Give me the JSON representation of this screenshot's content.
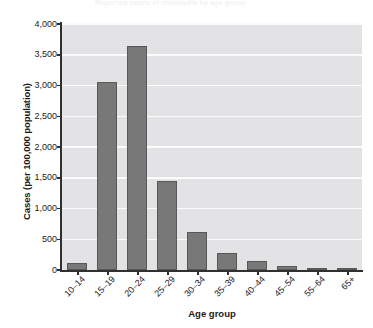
{
  "figure": {
    "title_remnant": "Reported cases of chlamydia by age group",
    "xlabel": "Age group",
    "ylabel": "Cases (per 100,000 population)"
  },
  "chart_data": {
    "type": "bar",
    "title": "",
    "xlabel": "Age group",
    "ylabel": "Cases (per 100,000 population)",
    "categories": [
      "10–14",
      "15–19",
      "20–24",
      "25–29",
      "30–34",
      "35–39",
      "40–44",
      "45–54",
      "55–64",
      "65+"
    ],
    "values": [
      110,
      3050,
      3640,
      1450,
      620,
      280,
      145,
      70,
      25,
      8
    ],
    "ylim": [
      0,
      4000
    ],
    "ytick_labels": [
      "0",
      "500",
      "1,000",
      "1,500",
      "2,000",
      "2,500",
      "3,000",
      "3,500",
      "4,000"
    ],
    "ytick_values": [
      0,
      500,
      1000,
      1500,
      2000,
      2500,
      3000,
      3500,
      4000
    ],
    "grid": "horizontal",
    "legend": "none",
    "bar_color": "#787878",
    "bar_edge_color": "#585858",
    "plot_background": "#e3e3e5",
    "gridline_color": "#fbfbfb",
    "axis_color": "#303030"
  }
}
